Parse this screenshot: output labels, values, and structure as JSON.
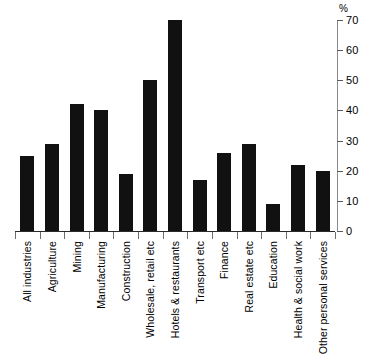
{
  "chart_data": {
    "type": "bar",
    "title": "",
    "subtitle": "",
    "xlabel": "",
    "ylabel": "%",
    "ylim": [
      0,
      70
    ],
    "ytick_step": 10,
    "yticks": [
      0,
      10,
      20,
      30,
      40,
      50,
      60,
      70
    ],
    "grid": false,
    "legend": null,
    "axis_position": "right",
    "bar_color": "#111111",
    "categories": [
      "All industries",
      "Agriculture",
      "Mining",
      "Manufacturing",
      "Construction",
      "Wholesale, retail etc",
      "Hotels & restaurants",
      "Transport etc",
      "Finance",
      "Real estate etc",
      "Education",
      "Health & social work",
      "Other personal services"
    ],
    "values": [
      25,
      29,
      42,
      40,
      19,
      50,
      70,
      17,
      26,
      29,
      9,
      22,
      20
    ]
  }
}
